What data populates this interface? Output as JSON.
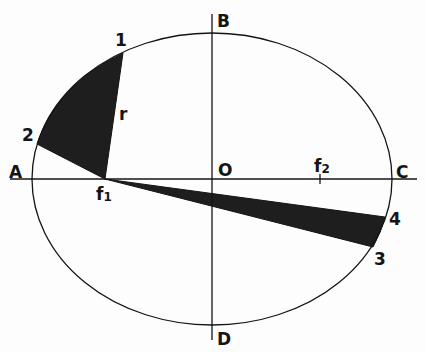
{
  "diagram": {
    "colors": {
      "ink": "#141414",
      "shade": "#1e1e1e",
      "background": "#fdfdfd"
    },
    "ellipse": {
      "cx": 212,
      "cy": 179,
      "rx": 180,
      "ry": 146
    },
    "axes": {
      "horizontal": {
        "x1": 10,
        "x2": 417,
        "y": 179
      },
      "vertical": {
        "x": 212,
        "y1": 14,
        "y2": 340
      }
    },
    "points": {
      "A": {
        "label": "A",
        "x": 32,
        "y": 179
      },
      "B": {
        "label": "B",
        "x": 212,
        "y": 33
      },
      "C": {
        "label": "C",
        "x": 392,
        "y": 179
      },
      "D": {
        "label": "D",
        "x": 212,
        "y": 325
      },
      "O": {
        "label": "O",
        "x": 212,
        "y": 179
      },
      "f1": {
        "label": "f",
        "sub": "1",
        "x": 105,
        "y": 179
      },
      "f2": {
        "label": "f",
        "sub": "2",
        "x": 320,
        "y": 179
      },
      "p1": {
        "label": "1",
        "x": 123,
        "y": 53
      },
      "p2": {
        "label": "2",
        "x": 37,
        "y": 144
      },
      "p3": {
        "label": "3",
        "x": 373,
        "y": 247
      },
      "p4": {
        "label": "4",
        "x": 385,
        "y": 217
      }
    },
    "radius_label": "r",
    "sectors": [
      {
        "name": "sector-1-2",
        "from": "p1",
        "to": "p2",
        "focus": "f1"
      },
      {
        "name": "sector-3-4",
        "from": "p4",
        "to": "p3",
        "focus": "f1"
      }
    ]
  }
}
